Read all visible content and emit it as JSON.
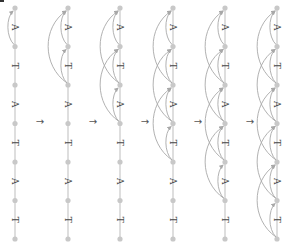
{
  "diagram": {
    "colors": {
      "node": "#c8c8c8",
      "edge": "#c8c8c8",
      "arc": "#a8a8a8",
      "label": "#444444",
      "arrow": "#555555"
    },
    "node_y": [
      8,
      46.5,
      85,
      123.5,
      162,
      200.5,
      239
    ],
    "labels": [
      "A",
      "T",
      "A",
      "T",
      "A",
      "T"
    ],
    "transition_symbol": "→",
    "columns": [
      {
        "x": 15,
        "reach": 1
      },
      {
        "x": 68,
        "reach": 2
      },
      {
        "x": 120,
        "reach": 3
      },
      {
        "x": 173,
        "reach": 4
      },
      {
        "x": 225,
        "reach": 5
      },
      {
        "x": 277,
        "reach": 6
      }
    ],
    "arrows_x": [
      40,
      93,
      145,
      198,
      250
    ],
    "arrows_y": 121
  }
}
